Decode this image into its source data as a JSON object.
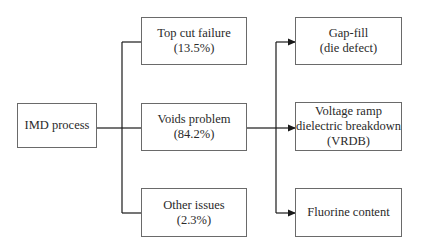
{
  "diagram": {
    "root": {
      "label": "IMD process"
    },
    "causes": [
      {
        "label": "Top cut failure",
        "percent": "(13.5%)"
      },
      {
        "label": "Voids problem",
        "percent": "(84.2%)"
      },
      {
        "label": "Other issues",
        "percent": "(2.3%)"
      }
    ],
    "effects": [
      {
        "line1": "Gap-fill",
        "line2": "(die defect)"
      },
      {
        "line1": "Voltage ramp",
        "line2": "dielectric breakdown",
        "line3": "(VRDB)"
      },
      {
        "line1": "Fluorine content"
      }
    ],
    "edges": [
      {
        "from": "IMD process",
        "to": "Top cut failure"
      },
      {
        "from": "IMD process",
        "to": "Voids problem"
      },
      {
        "from": "IMD process",
        "to": "Other issues"
      },
      {
        "from": "Voids problem",
        "to": "Gap-fill (die defect)"
      },
      {
        "from": "Voids problem",
        "to": "Voltage ramp dielectric breakdown (VRDB)"
      },
      {
        "from": "Voids problem",
        "to": "Fluorine content"
      }
    ],
    "colors": {
      "line": "#1a1a1a",
      "border": "#6a6a6a",
      "text": "#2a2a2a"
    }
  }
}
